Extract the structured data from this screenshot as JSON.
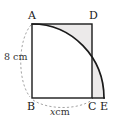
{
  "figure": {
    "vertices": [
      {
        "name": "A",
        "label": "A",
        "x": 32,
        "y": 24
      },
      {
        "name": "D",
        "label": "D",
        "x": 92,
        "y": 24
      },
      {
        "name": "B",
        "label": "B",
        "x": 32,
        "y": 98
      },
      {
        "name": "C",
        "label": "C",
        "x": 92,
        "y": 98
      },
      {
        "name": "E",
        "label": "E",
        "x": 104,
        "y": 98
      }
    ],
    "dimensions": {
      "height_label": "8 cm",
      "height_value": "8",
      "height_unit": "cm",
      "base_label_var": "x",
      "base_label_unit": "cm"
    },
    "colors": {
      "stroke": "#1a1a1a",
      "shade": "#eceaea",
      "dashed": "#8c8c8c",
      "background": "#ffffff"
    },
    "arc": {
      "center": "B",
      "radius_px": 74,
      "from": "A",
      "to": "E",
      "description": "quarter circle centred at B radius 8 cm"
    }
  }
}
